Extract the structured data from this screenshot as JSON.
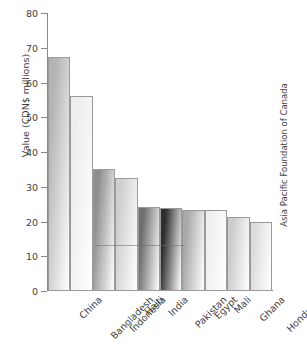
{
  "chart_data": {
    "type": "bar",
    "title": "",
    "xlabel": "",
    "ylabel": "Value (CDN$ millions)",
    "ylim": [
      0,
      80
    ],
    "yticks": [
      0,
      10,
      20,
      30,
      40,
      50,
      60,
      70,
      80
    ],
    "grid": false,
    "legend": null,
    "categories": [
      "China",
      "Bangladesh",
      "Indonesia",
      "Haiti",
      "India",
      "Pakistan",
      "Egypt",
      "Mali",
      "Ghana",
      "Honduras"
    ],
    "values": [
      67.3,
      56.2,
      35.0,
      32.6,
      24.1,
      23.8,
      23.4,
      23.3,
      21.2,
      20.0
    ],
    "bar_shades": [
      "#b4b4b4",
      "#ededed",
      "#8e8e8e",
      "#cfcfcf",
      "#6e6e6e",
      "#2e2e2e",
      "#a8a8a8",
      "#efefef",
      "#cccccc",
      "#dcdcdc"
    ],
    "annotations": [
      "Asia Pacific Foundation of Canada"
    ]
  },
  "axes": {
    "y_title": "Value (CDN$ millions)",
    "y_tick_labels": [
      "80",
      "70",
      "60",
      "50",
      "40",
      "30",
      "20",
      "10",
      "0"
    ]
  },
  "credit": {
    "text": "Asia Pacific Foundation of Canada"
  }
}
